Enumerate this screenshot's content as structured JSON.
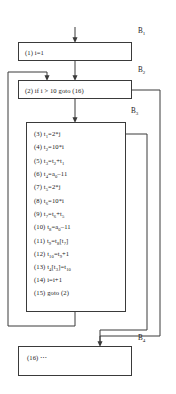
{
  "diagram": {
    "type": "control-flow-graph",
    "stroke_color": "#3a3a3a",
    "background_color": "#ffffff"
  },
  "blocks": [
    {
      "id": "B1",
      "label": "B",
      "label_sub": "1",
      "statements": [
        {
          "num": "(1)",
          "code": "i=1"
        }
      ]
    },
    {
      "id": "B2",
      "label": "B",
      "label_sub": "2",
      "statements": [
        {
          "num": "(2)",
          "code": "if i > 10 goto (16)"
        }
      ]
    },
    {
      "id": "B3",
      "label": "B",
      "label_sub": "3",
      "statements": [
        {
          "num": "(3)",
          "code": "t1=2*j"
        },
        {
          "num": "(4)",
          "code": "t2=10*i"
        },
        {
          "num": "(5)",
          "code": "t3=t2+t1"
        },
        {
          "num": "(6)",
          "code": "t4=a0-11"
        },
        {
          "num": "(7)",
          "code": "t5=2*j"
        },
        {
          "num": "(8)",
          "code": "t6=10*i"
        },
        {
          "num": "(9)",
          "code": "t7=t6+t5"
        },
        {
          "num": "(10)",
          "code": "t8=a0-11"
        },
        {
          "num": "(11)",
          "code": "t9=t8[t7]"
        },
        {
          "num": "(12)",
          "code": "t10=t9+1"
        },
        {
          "num": "(13)",
          "code": "t4[t3]=t10"
        },
        {
          "num": "(14)",
          "code": "i=i+1"
        },
        {
          "num": "(15)",
          "code": "goto (2)"
        }
      ]
    },
    {
      "id": "B4",
      "label": "B",
      "label_sub": "4",
      "statements": [
        {
          "num": "(16)",
          "code": "⋯"
        }
      ]
    }
  ],
  "statement_text": {
    "s1": "(1) i=1",
    "s2": "(2) if i > 10 goto (16)",
    "s3": "(3) t",
    "s3b": "=2*j",
    "s3sub": "1",
    "s4": "(4) t",
    "s4b": "=10*i",
    "s4sub": "2",
    "s5": "(5) t",
    "s5sub": "3",
    "s6": "(6) t",
    "s6sub": "4",
    "s7": "(7) t",
    "s7sub": "5",
    "s7b": "=2*j",
    "s8": "(8) t",
    "s8sub": "6",
    "s8b": "=10*i",
    "s9": "(9) t",
    "s9sub": "7",
    "s10": "(10) t",
    "s10sub": "8",
    "s11": "(11) t",
    "s11sub": "9",
    "s12": "(12) t",
    "s12sub": "10",
    "s13": "(13) t",
    "s13sub": "4",
    "s14": "(14) i=i+1",
    "s15": "(15) goto (2)",
    "s16": "(16) ⋯"
  },
  "edges": [
    {
      "name": "entry-to-b1",
      "from": "entry",
      "to": "B1"
    },
    {
      "name": "b1-to-b2",
      "from": "B1",
      "to": "B2"
    },
    {
      "name": "b2-to-b3",
      "from": "B2",
      "to": "B3"
    },
    {
      "name": "b3-back-to-b2",
      "from": "B3",
      "to": "B2",
      "kind": "back-edge"
    },
    {
      "name": "b2-to-b4",
      "from": "B2",
      "to": "B4",
      "kind": "branch-taken"
    },
    {
      "name": "b3-to-b4",
      "from": "B3",
      "to": "B4"
    }
  ]
}
